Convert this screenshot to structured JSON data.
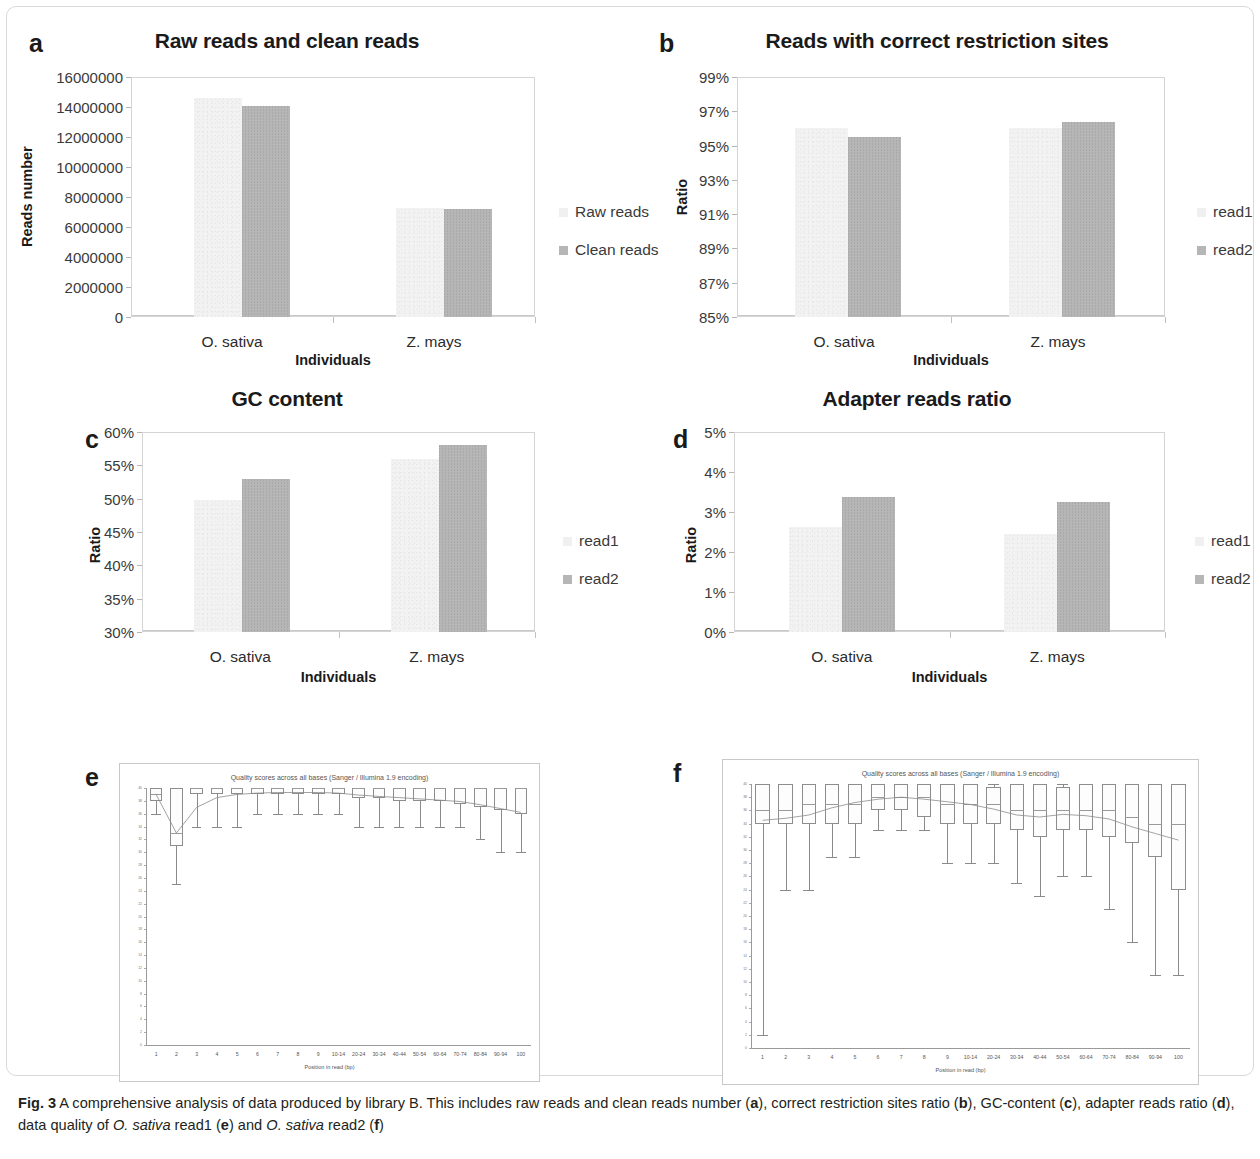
{
  "figure": {
    "label": "Fig. 3",
    "caption_parts": {
      "p1": "A comprehensive analysis of data produced by library B. This includes raw reads and clean reads number (",
      "a": "a",
      "p2": "), correct restriction sites ratio (",
      "b": "b",
      "p3": "), GC-content (",
      "c": "c",
      "p4": "), adapter reads ratio (",
      "d": "d",
      "p5": "), data quality of ",
      "sp1": "O. sativa",
      "p6": " read1 (",
      "e": "e",
      "p7": ") and ",
      "sp2": "O. sativa",
      "p8": " read2 (",
      "f": "f",
      "p9": ")"
    }
  },
  "colors": {
    "series_light": "#f0f0f0",
    "series_dark": "#b6b6b6",
    "axis": "#d5d5d5",
    "text": "#231f20"
  },
  "chart_data": [
    {
      "panel": "a",
      "type": "bar",
      "title": "Raw reads and clean reads",
      "xlabel": "Individuals",
      "ylabel": "Reads number",
      "categories": [
        "O. sativa",
        "Z. mays"
      ],
      "series": [
        {
          "name": "Raw reads",
          "values": [
            14600000,
            7250000
          ]
        },
        {
          "name": "Clean reads",
          "values": [
            14100000,
            7230000
          ]
        }
      ],
      "ylim": [
        0,
        16000000
      ],
      "yticks": [
        "16000000",
        "14000000",
        "12000000",
        "10000000",
        "8000000",
        "6000000",
        "4000000",
        "2000000",
        "0"
      ],
      "grid": false,
      "legend_position": "right"
    },
    {
      "panel": "b",
      "type": "bar",
      "title": "Reads with correct restriction sites",
      "xlabel": "Individuals",
      "ylabel": "Ratio",
      "categories": [
        "O. sativa",
        "Z. mays"
      ],
      "series": [
        {
          "name": "read1",
          "values": [
            96.0,
            96.0
          ]
        },
        {
          "name": "read2",
          "values": [
            95.5,
            96.4
          ]
        }
      ],
      "ylim": [
        85,
        99
      ],
      "yticks": [
        "99%",
        "97%",
        "95%",
        "93%",
        "91%",
        "89%",
        "87%",
        "85%"
      ],
      "grid": false,
      "legend_position": "right"
    },
    {
      "panel": "c",
      "type": "bar",
      "title": "GC content",
      "xlabel": "Individuals",
      "ylabel": "Ratio",
      "categories": [
        "O. sativa",
        "Z. mays"
      ],
      "series": [
        {
          "name": "read1",
          "values": [
            49.8,
            56.0
          ]
        },
        {
          "name": "read2",
          "values": [
            53.0,
            58.0
          ]
        }
      ],
      "ylim": [
        30,
        60
      ],
      "yticks": [
        "60%",
        "55%",
        "50%",
        "45%",
        "40%",
        "35%",
        "30%"
      ],
      "grid": false,
      "legend_position": "right"
    },
    {
      "panel": "d",
      "type": "bar",
      "title": "Adapter reads ratio",
      "xlabel": "Individuals",
      "ylabel": "Ratio",
      "categories": [
        "O. sativa",
        "Z. mays"
      ],
      "series": [
        {
          "name": "read1",
          "values": [
            2.62,
            2.45
          ]
        },
        {
          "name": "read2",
          "values": [
            3.37,
            3.25
          ]
        }
      ],
      "ylim": [
        0,
        5
      ],
      "yticks": [
        "5%",
        "4%",
        "3%",
        "2%",
        "1%",
        "0%"
      ],
      "grid": false,
      "legend_position": "right"
    },
    {
      "panel": "e",
      "type": "boxplot",
      "title": "Quality scores across all bases (Sanger / Illumina 1.9 encoding)",
      "xlabel": "Position in read (bp)",
      "ylabel": "",
      "ylim": [
        0,
        40
      ],
      "yticks": [
        "40",
        "38",
        "36",
        "34",
        "32",
        "30",
        "28",
        "26",
        "24",
        "22",
        "20",
        "18",
        "16",
        "14",
        "12",
        "10",
        "8",
        "6",
        "4",
        "2",
        "0"
      ],
      "xticks": [
        "1",
        "2",
        "3",
        "4",
        "5",
        "6",
        "7",
        "8",
        "9",
        "10-14",
        "20-24",
        "30-34",
        "40-44",
        "50-54",
        "60-64",
        "70-74",
        "80-84",
        "90-94",
        "100"
      ],
      "boxes": [
        {
          "x": "1",
          "low": 36,
          "q1": 38,
          "med": 39,
          "q3": 40,
          "high": 40,
          "mean": 39
        },
        {
          "x": "2",
          "low": 25,
          "q1": 31,
          "med": 33,
          "q3": 40,
          "high": 40,
          "mean": 33
        },
        {
          "x": "3",
          "low": 34,
          "q1": 39,
          "med": 40,
          "q3": 40,
          "high": 40,
          "mean": 37
        },
        {
          "x": "4",
          "low": 34,
          "q1": 39,
          "med": 40,
          "q3": 40,
          "high": 40,
          "mean": 38.5
        },
        {
          "x": "5",
          "low": 34,
          "q1": 39,
          "med": 40,
          "q3": 40,
          "high": 40,
          "mean": 39
        },
        {
          "x": "6",
          "low": 36,
          "q1": 39,
          "med": 40,
          "q3": 40,
          "high": 40,
          "mean": 39.2
        },
        {
          "x": "7",
          "low": 36,
          "q1": 39,
          "med": 40,
          "q3": 40,
          "high": 40,
          "mean": 39.3
        },
        {
          "x": "8",
          "low": 36,
          "q1": 39,
          "med": 40,
          "q3": 40,
          "high": 40,
          "mean": 39.3
        },
        {
          "x": "9",
          "low": 36,
          "q1": 39,
          "med": 40,
          "q3": 40,
          "high": 40,
          "mean": 39.3
        },
        {
          "x": "10-14",
          "low": 36,
          "q1": 39,
          "med": 40,
          "q3": 40,
          "high": 40,
          "mean": 39.2
        },
        {
          "x": "20-24",
          "low": 34,
          "q1": 38.5,
          "med": 40,
          "q3": 40,
          "high": 40,
          "mean": 38.9
        },
        {
          "x": "30-34",
          "low": 34,
          "q1": 38.5,
          "med": 40,
          "q3": 40,
          "high": 40,
          "mean": 38.7
        },
        {
          "x": "40-44",
          "low": 34,
          "q1": 38,
          "med": 40,
          "q3": 40,
          "high": 40,
          "mean": 38.5
        },
        {
          "x": "50-54",
          "low": 34,
          "q1": 38,
          "med": 40,
          "q3": 40,
          "high": 40,
          "mean": 38.3
        },
        {
          "x": "60-64",
          "low": 34,
          "q1": 38,
          "med": 40,
          "q3": 40,
          "high": 40,
          "mean": 38.1
        },
        {
          "x": "70-74",
          "low": 34,
          "q1": 37.5,
          "med": 40,
          "q3": 40,
          "high": 40,
          "mean": 37.9
        },
        {
          "x": "80-84",
          "low": 32,
          "q1": 37,
          "med": 40,
          "q3": 40,
          "high": 40,
          "mean": 37.4
        },
        {
          "x": "90-94",
          "low": 30,
          "q1": 36.5,
          "med": 40,
          "q3": 40,
          "high": 40,
          "mean": 36.8
        },
        {
          "x": "100",
          "low": 30,
          "q1": 36,
          "med": 40,
          "q3": 40,
          "high": 40,
          "mean": 36.2
        }
      ]
    },
    {
      "panel": "f",
      "type": "boxplot",
      "title": "Quality scores across all bases (Sanger / Illumina 1.9 encoding)",
      "xlabel": "Position in read (bp)",
      "ylabel": "",
      "ylim": [
        0,
        40
      ],
      "yticks": [
        "40",
        "38",
        "36",
        "34",
        "32",
        "30",
        "28",
        "26",
        "24",
        "22",
        "20",
        "18",
        "16",
        "14",
        "12",
        "10",
        "8",
        "6",
        "4",
        "2",
        "0"
      ],
      "xticks": [
        "1",
        "2",
        "3",
        "4",
        "5",
        "6",
        "7",
        "8",
        "9",
        "10-14",
        "20-24",
        "30-34",
        "40-44",
        "50-54",
        "60-64",
        "70-74",
        "80-84",
        "90-94",
        "100"
      ],
      "boxes": [
        {
          "x": "1",
          "low": 2,
          "q1": 34,
          "med": 36,
          "q3": 40,
          "high": 40,
          "mean": 34.5
        },
        {
          "x": "2",
          "low": 24,
          "q1": 34,
          "med": 36,
          "q3": 40,
          "high": 40,
          "mean": 34.8
        },
        {
          "x": "3",
          "low": 24,
          "q1": 34,
          "med": 37,
          "q3": 40,
          "high": 40,
          "mean": 35.3
        },
        {
          "x": "4",
          "low": 29,
          "q1": 34,
          "med": 37,
          "q3": 40,
          "high": 40,
          "mean": 36.4
        },
        {
          "x": "5",
          "low": 29,
          "q1": 34,
          "med": 37,
          "q3": 40,
          "high": 40,
          "mean": 37.2
        },
        {
          "x": "6",
          "low": 33,
          "q1": 36,
          "med": 38,
          "q3": 40,
          "high": 40,
          "mean": 37.7
        },
        {
          "x": "7",
          "low": 33,
          "q1": 36,
          "med": 38,
          "q3": 40,
          "high": 40,
          "mean": 38.0
        },
        {
          "x": "8",
          "low": 33,
          "q1": 35,
          "med": 38,
          "q3": 40,
          "high": 40,
          "mean": 37.7
        },
        {
          "x": "9",
          "low": 28,
          "q1": 34,
          "med": 37,
          "q3": 40,
          "high": 40,
          "mean": 37.3
        },
        {
          "x": "10-14",
          "low": 28,
          "q1": 34,
          "med": 37,
          "q3": 40,
          "high": 40,
          "mean": 36.9
        },
        {
          "x": "20-24",
          "low": 28,
          "q1": 34,
          "med": 37,
          "q3": 39.5,
          "high": 40,
          "mean": 36.2
        },
        {
          "x": "30-34",
          "low": 25,
          "q1": 33,
          "med": 36,
          "q3": 40,
          "high": 40,
          "mean": 35.3
        },
        {
          "x": "40-44",
          "low": 23,
          "q1": 32,
          "med": 36,
          "q3": 40,
          "high": 40,
          "mean": 35.0
        },
        {
          "x": "50-54",
          "low": 26,
          "q1": 33,
          "med": 36,
          "q3": 39.5,
          "high": 40,
          "mean": 35.4
        },
        {
          "x": "60-64",
          "low": 26,
          "q1": 33,
          "med": 36,
          "q3": 40,
          "high": 40,
          "mean": 35.2
        },
        {
          "x": "70-74",
          "low": 21,
          "q1": 32,
          "med": 36,
          "q3": 40,
          "high": 40,
          "mean": 34.7
        },
        {
          "x": "80-84",
          "low": 16,
          "q1": 31,
          "med": 35,
          "q3": 40,
          "high": 40,
          "mean": 33.5
        },
        {
          "x": "90-94",
          "low": 11,
          "q1": 29,
          "med": 34,
          "q3": 40,
          "high": 40,
          "mean": 32.5
        },
        {
          "x": "100",
          "low": 11,
          "q1": 24,
          "med": 34,
          "q3": 40,
          "high": 40,
          "mean": 31.5
        }
      ]
    }
  ]
}
